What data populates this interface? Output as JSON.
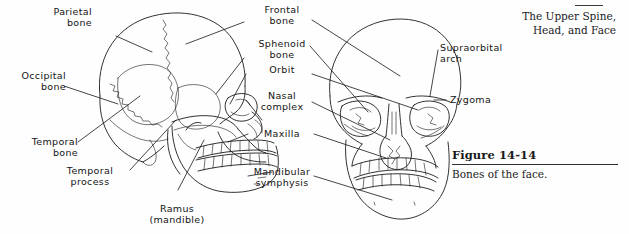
{
  "running_head": {
    "line1": "The Upper Spine,",
    "line2": "Head, and Face"
  },
  "figure": {
    "number": "Figure 14-14",
    "caption": "Bones of the face."
  },
  "illustration": {
    "type": "anatomical line drawing",
    "views": [
      {
        "name": "lateral-skull",
        "description": "Left lateral view of the human skull"
      },
      {
        "name": "frontal-skull",
        "description": "Anterior view of the human skull"
      }
    ],
    "ink_color": "#1b1b1b",
    "background_color": "#fefefe"
  },
  "labels": {
    "parietal_bone": "Parietal\nbone",
    "occipital_bone": "Occipital\nbone",
    "temporal_bone": "Temporal\nbone",
    "temporal_process": "Temporal\nprocess",
    "ramus_mandible": "Ramus\n(mandible)",
    "frontal_bone": "Frontal\nbone",
    "sphenoid_bone": "Sphenoid\nbone",
    "orbit": "Orbit",
    "nasal_complex": "Nasal\ncomplex",
    "maxilla": "Maxilla",
    "mandibular_symphysis": "Mandibular\nsymphysis",
    "supraorbital_arch": "Supraorbital\narch",
    "zygoma": "Zygoma"
  }
}
